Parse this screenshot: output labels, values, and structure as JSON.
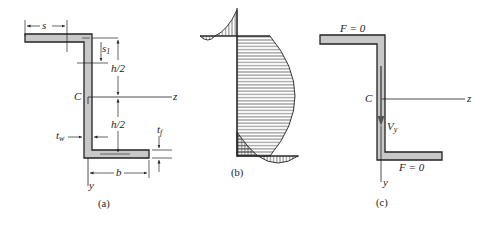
{
  "figure": {
    "panels": [
      {
        "id": "a",
        "caption": "(a)",
        "description": "Z-section cross-section with dimensions",
        "labels": {
          "s": "s",
          "s1": "s",
          "s1_sub": "1",
          "h_half_upper": "h/2",
          "h_half_lower": "h/2",
          "centroid": "C",
          "z_axis": "z",
          "y_axis": "y",
          "web_thickness": "t",
          "web_thickness_sub": "w",
          "flange_thickness": "t",
          "flange_thickness_sub": "f",
          "flange_width": "b"
        }
      },
      {
        "id": "b",
        "caption": "(b)",
        "description": "Shear stress distribution (hatched) over Z-section: parabolic in web, linear-to-reversing in flanges"
      },
      {
        "id": "c",
        "caption": "(c)",
        "description": "Resultant shear forces on Z-section",
        "labels": {
          "top_flange_force": "F = 0",
          "bottom_flange_force": "F = 0",
          "centroid": "C",
          "z_axis": "z",
          "y_axis": "y",
          "shear_force": "V",
          "shear_force_sub": "y"
        }
      }
    ],
    "colors": {
      "section_fill": "#c8c8c8",
      "line": "#222222",
      "hatch": "#333333"
    }
  }
}
